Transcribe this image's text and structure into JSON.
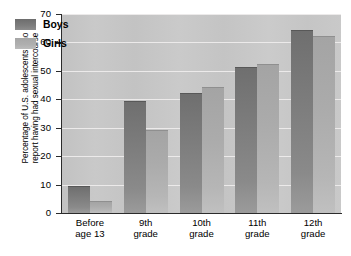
{
  "chart_data": {
    "type": "bar",
    "title": "",
    "xlabel": "",
    "ylabel_line1": "Percentage of U.S. adolescents who",
    "ylabel_line2": "report having had sexual intercourse",
    "categories": [
      {
        "line1": "Before",
        "line2": "age 13"
      },
      {
        "line1": "9th",
        "line2": "grade"
      },
      {
        "line1": "10th",
        "line2": "grade"
      },
      {
        "line1": "11th",
        "line2": "grade"
      },
      {
        "line1": "12th",
        "line2": "grade"
      }
    ],
    "series": [
      {
        "name": "Boys",
        "color": "#7b7b7b",
        "values": [
          9,
          39,
          42,
          51,
          64
        ]
      },
      {
        "name": "Girls",
        "color": "#ababab",
        "values": [
          4,
          29,
          44,
          52,
          62
        ]
      }
    ],
    "ylim": [
      0,
      70
    ],
    "ytick_values": [
      0,
      10,
      20,
      30,
      40,
      50,
      60,
      70
    ],
    "ytick_labels": [
      "0",
      "10",
      "20",
      "30",
      "40",
      "50",
      "60",
      "70"
    ],
    "grid": true,
    "grid_axis": "y",
    "legend_position": "top-left",
    "plot_background": "#c6c6c6"
  }
}
